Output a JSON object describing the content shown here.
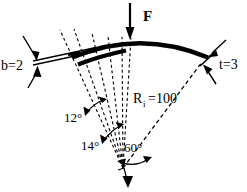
{
  "figure": {
    "labels": {
      "force": "F",
      "width": "b=2",
      "thickness": "t=3",
      "inner_radius_main": "R",
      "inner_radius_sub": "i",
      "inner_radius_value": "=100",
      "angle_1": "12°",
      "angle_2": "14°",
      "angle_3": "60°"
    },
    "colors": {
      "ink": "#000000",
      "background": "#ffffff"
    },
    "geometry": {
      "apex_x": 123,
      "apex_y": 168,
      "arc_start_x": 72,
      "arc_start_y": 56,
      "arc_end_x": 208,
      "arc_end_y": 58,
      "force_arrow_x": 130,
      "force_arrow_top_y": 3,
      "force_arrow_bottom_y": 38
    }
  }
}
